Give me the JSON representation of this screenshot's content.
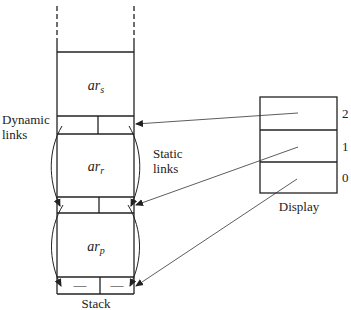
{
  "diagram": {
    "stack": {
      "label": "Stack",
      "records": [
        {
          "name": "ar",
          "sub": "s"
        },
        {
          "name": "ar",
          "sub": "r"
        },
        {
          "name": "ar",
          "sub": "p"
        }
      ],
      "bottom_link_marks": [
        "—",
        "—"
      ]
    },
    "labels": {
      "dynamic_links_line1": "Dynamic",
      "dynamic_links_line2": "links",
      "static_links_line1": "Static",
      "static_links_line2": "links"
    },
    "display": {
      "label": "Display",
      "indices": [
        "2",
        "1",
        "0"
      ]
    },
    "colors": {
      "stroke": "#222222",
      "background": "#ffffff"
    }
  }
}
